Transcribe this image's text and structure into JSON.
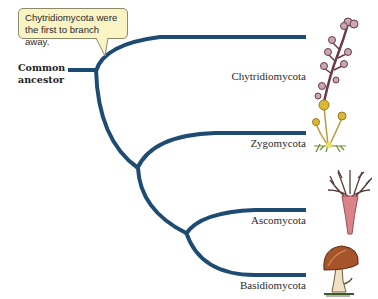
{
  "diagram": {
    "type": "cladogram",
    "callout": {
      "line1": "Chytridiomycota were",
      "line2": "the first to branch away."
    },
    "root": {
      "line1": "Common",
      "line2": "ancestor"
    },
    "taxa": [
      {
        "name": "Chytridiomycota",
        "illustration": "chytrid-sporangia-icon"
      },
      {
        "name": "Zygomycota",
        "illustration": "bread-mold-icon"
      },
      {
        "name": "Ascomycota",
        "illustration": "cup-fungus-icon"
      },
      {
        "name": "Basidiomycota",
        "illustration": "mushroom-icon"
      }
    ],
    "colors": {
      "branch": "#1e4b72",
      "callout_fill": "#faf3c4",
      "callout_border": "#8a8a6a"
    }
  }
}
